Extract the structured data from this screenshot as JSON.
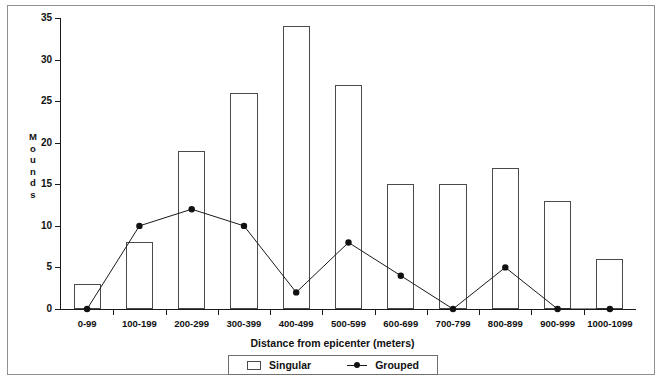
{
  "chart_data": {
    "type": "bar",
    "title": "",
    "xlabel": "Distance from epicenter (meters)",
    "ylabel": "Mounds",
    "ylim": [
      0,
      35
    ],
    "yticks": [
      0,
      5,
      10,
      15,
      20,
      25,
      30,
      35
    ],
    "grid": false,
    "legend_position": "bottom",
    "categories": [
      "0-99",
      "100-199",
      "200-299",
      "300-399",
      "400-499",
      "500-599",
      "600-699",
      "700-799",
      "800-899",
      "900-999",
      "1000-1099"
    ],
    "series": [
      {
        "name": "Singular",
        "render": "bar",
        "values": [
          3,
          8,
          19,
          26,
          34,
          27,
          15,
          15,
          17,
          13,
          6
        ]
      },
      {
        "name": "Grouped",
        "render": "line-marker",
        "values": [
          0,
          10,
          12,
          10,
          2,
          8,
          4,
          0,
          5,
          0,
          0
        ]
      }
    ]
  },
  "axes": {
    "ylabel_chars": [
      "M",
      "o",
      "u",
      "n",
      "d",
      "s"
    ],
    "ytick_labels": [
      "35",
      "30",
      "25",
      "20",
      "15",
      "10",
      "5",
      "0"
    ],
    "xtick_labels": [
      "0-99",
      "100-199",
      "200-299",
      "300-399",
      "400-499",
      "500-599",
      "600-699",
      "700-799",
      "800-899",
      "900-999",
      "1000-1099"
    ],
    "xlabel": "Distance from epicenter (meters)"
  },
  "legend": {
    "entries": [
      {
        "label": "Singular",
        "symbol": "open-rectangle",
        "color": "#ffffff"
      },
      {
        "label": "Grouped",
        "symbol": "line-with-dot",
        "color": "#111111"
      }
    ]
  },
  "colors": {
    "bar_stroke": "#4a4a4a",
    "bar_fill": "#ffffff",
    "line": "#1a1a1a",
    "marker": "#111111",
    "axis": "#1a1a1a",
    "frame": "#909090",
    "background": "#ffffff"
  }
}
